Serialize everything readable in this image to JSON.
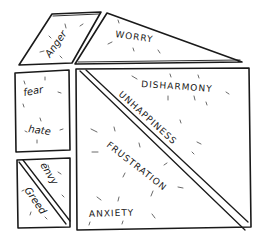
{
  "diagram": {
    "type": "hand-drawn emotion puzzle (tangram-like shapes)",
    "shapes": [
      {
        "id": "anger",
        "shape": "parallelogram",
        "labels": [
          "Anger"
        ]
      },
      {
        "id": "worry",
        "shape": "triangle",
        "labels": [
          "WORRY"
        ]
      },
      {
        "id": "fear-hate",
        "shape": "rectangle",
        "labels": [
          "fear",
          "hate"
        ]
      },
      {
        "id": "envy-greed",
        "shape": "square split diagonally",
        "labels": [
          "envy",
          "Greed"
        ]
      },
      {
        "id": "disharmony-unhappiness",
        "shape": "triangle (upper-right half of large square)",
        "labels": [
          "DISHARMONY",
          "UNHAPPINESS"
        ]
      },
      {
        "id": "frustration-anxiety",
        "shape": "triangle (lower-left half of large square)",
        "labels": [
          "FRUSTRATION",
          "ANXIETY"
        ]
      }
    ]
  },
  "labels": {
    "anger": "Anger",
    "worry": "WORRY",
    "fear": "fear",
    "hate": "hate",
    "envy": "envy",
    "greed": "Greed",
    "disharmony": "DISHARMONY",
    "unhappiness": "UNHAPPINESS",
    "frustration": "FRUSTRATION",
    "anxiety": "ANXIETY"
  },
  "colors": {
    "ink": "#1a1a1a",
    "paper": "#ffffff"
  }
}
